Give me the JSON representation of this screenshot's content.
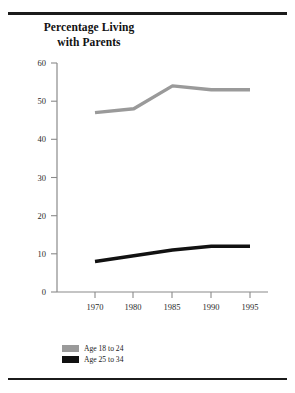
{
  "figure": {
    "title_lines": [
      "Percentage Living",
      "with Parents"
    ],
    "title_full": "Percentage Living with Parents"
  },
  "colors": {
    "series_18_24": "#9a9a9a",
    "series_25_34": "#111111",
    "axis": "#8a8a8a",
    "rule": "#1b1b1b",
    "text": "#1a1a1a",
    "background": "#ffffff"
  },
  "legend": {
    "position": "bottom-left",
    "items": [
      {
        "label": "Age 18 to 24",
        "color": "#9a9a9a"
      },
      {
        "label": "Age 25 to 34",
        "color": "#111111"
      }
    ]
  },
  "axes": {
    "y_ticks": [
      "0",
      "10",
      "20",
      "30",
      "40",
      "50",
      "60"
    ],
    "x_ticks": [
      "1970",
      "1980",
      "1985",
      "1990",
      "1995"
    ]
  },
  "chart_data": {
    "type": "line",
    "title": "Percentage Living with Parents",
    "xlabel": "",
    "ylabel": "",
    "categories": [
      "1970",
      "1980",
      "1985",
      "1990",
      "1995"
    ],
    "x": [
      1970,
      1980,
      1985,
      1990,
      1995
    ],
    "ylim": [
      0,
      60
    ],
    "yticks": [
      0,
      10,
      20,
      30,
      40,
      50,
      60
    ],
    "grid": false,
    "legend_position": "bottom-left",
    "series": [
      {
        "name": "Age 18 to 24",
        "color": "#9a9a9a",
        "values": [
          47,
          48,
          54,
          53,
          53
        ]
      },
      {
        "name": "Age 25 to 34",
        "color": "#111111",
        "values": [
          8,
          9.5,
          11,
          12,
          12
        ]
      }
    ]
  }
}
